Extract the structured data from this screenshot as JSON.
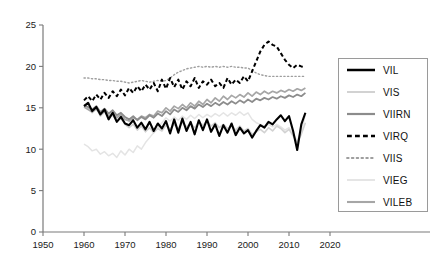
{
  "chart_data": {
    "type": "line",
    "title": "",
    "xlabel": "",
    "ylabel": "",
    "xlim": [
      1950,
      2020
    ],
    "ylim": [
      0,
      25
    ],
    "xticks": [
      1950,
      1960,
      1970,
      1980,
      1990,
      2000,
      2010,
      2020
    ],
    "yticks": [
      0,
      5,
      10,
      15,
      20,
      25
    ],
    "grid": false,
    "legend_position": "right-outside",
    "x": [
      1960,
      1961,
      1962,
      1963,
      1964,
      1965,
      1966,
      1967,
      1968,
      1969,
      1970,
      1971,
      1972,
      1973,
      1974,
      1975,
      1976,
      1977,
      1978,
      1979,
      1980,
      1981,
      1982,
      1983,
      1984,
      1985,
      1986,
      1987,
      1988,
      1989,
      1990,
      1991,
      1992,
      1993,
      1994,
      1995,
      1996,
      1997,
      1998,
      1999,
      2000,
      2001,
      2002,
      2003,
      2004,
      2005,
      2006,
      2007,
      2008,
      2009,
      2010,
      2011,
      2012,
      2013,
      2014
    ],
    "series": [
      {
        "name": "VIL",
        "color": "#000000",
        "width": 2.1,
        "dash": "none",
        "values": [
          15.2,
          15.6,
          14.6,
          15.1,
          14.2,
          14.8,
          13.6,
          14.4,
          13.3,
          13.9,
          13.1,
          12.9,
          13.5,
          12.6,
          13.2,
          12.4,
          13.3,
          12.2,
          13.1,
          12.5,
          13.4,
          11.9,
          13.6,
          12.0,
          13.7,
          12.2,
          13.3,
          11.8,
          13.5,
          12.3,
          13.6,
          12.1,
          13.0,
          11.6,
          12.9,
          12.0,
          13.1,
          11.7,
          12.6,
          11.9,
          12.3,
          11.4,
          12.2,
          12.9,
          12.6,
          13.3,
          13.0,
          13.6,
          14.1,
          13.4,
          14.0,
          12.2,
          9.9,
          13.0,
          14.4
        ]
      },
      {
        "name": "VIS",
        "color": "#d2d2d2",
        "width": 1.6,
        "dash": "none",
        "values": [
          15.4,
          15.0,
          14.4,
          14.9,
          14.0,
          14.5,
          13.8,
          14.1,
          13.4,
          13.7,
          13.0,
          12.6,
          13.0,
          12.3,
          12.8,
          12.1,
          12.6,
          12.0,
          12.5,
          12.2,
          12.9,
          12.4,
          13.0,
          12.5,
          13.2,
          12.7,
          13.1,
          12.6,
          13.3,
          12.9,
          13.4,
          12.8,
          13.2,
          12.6,
          13.0,
          12.5,
          12.9,
          12.3,
          12.8,
          12.2,
          12.5,
          11.8,
          12.1,
          12.4,
          12.0,
          12.6,
          12.2,
          12.8,
          12.5,
          12.0,
          12.4,
          11.6,
          10.8,
          11.8,
          13.2
        ]
      },
      {
        "name": "VIIRN",
        "color": "#8c8c8c",
        "width": 1.8,
        "dash": "none",
        "values": [
          15.3,
          15.1,
          14.8,
          15.2,
          14.5,
          14.9,
          14.3,
          14.7,
          14.1,
          14.4,
          13.9,
          13.6,
          14.0,
          13.5,
          13.9,
          13.6,
          14.1,
          13.8,
          14.3,
          14.0,
          14.6,
          14.2,
          14.8,
          14.5,
          15.0,
          14.7,
          15.2,
          14.9,
          15.4,
          15.1,
          15.5,
          15.2,
          15.6,
          15.3,
          15.7,
          15.4,
          15.8,
          15.5,
          15.9,
          15.6,
          16.0,
          15.7,
          16.1,
          15.9,
          16.2,
          16.0,
          16.3,
          16.1,
          16.4,
          16.2,
          16.5,
          16.3,
          16.6,
          16.4,
          16.8
        ]
      },
      {
        "name": "VIRQ",
        "color": "#000000",
        "width": 2.0,
        "dash": "dashed",
        "values": [
          15.9,
          16.4,
          15.8,
          16.6,
          16.0,
          16.8,
          16.2,
          17.0,
          16.4,
          17.2,
          16.5,
          17.4,
          16.8,
          17.6,
          17.0,
          17.8,
          17.2,
          18.0,
          17.0,
          18.4,
          17.3,
          18.6,
          17.5,
          18.4,
          17.2,
          18.2,
          17.6,
          18.6,
          17.4,
          18.2,
          17.8,
          18.4,
          17.6,
          18.0,
          17.4,
          18.6,
          17.8,
          18.4,
          18.0,
          18.8,
          18.2,
          19.4,
          20.6,
          21.8,
          22.6,
          23.0,
          22.6,
          22.4,
          21.6,
          20.8,
          20.2,
          19.8,
          20.2,
          20.0,
          19.9
        ]
      },
      {
        "name": "VIIS",
        "color": "#9e9e9e",
        "width": 1.4,
        "dash": "dotted",
        "values": [
          18.6,
          18.6,
          18.5,
          18.5,
          18.4,
          18.4,
          18.3,
          18.3,
          18.2,
          18.2,
          18.1,
          18.0,
          18.1,
          18.2,
          18.3,
          18.2,
          18.1,
          18.2,
          18.3,
          18.2,
          18.3,
          18.6,
          19.0,
          19.3,
          19.5,
          19.7,
          19.8,
          19.9,
          20.0,
          19.9,
          20.0,
          19.9,
          20.0,
          19.9,
          20.0,
          19.9,
          20.0,
          19.9,
          19.9,
          19.8,
          19.8,
          19.5,
          19.2,
          19.0,
          18.9,
          18.8,
          18.8,
          18.8,
          18.8,
          18.8,
          18.8,
          18.8,
          18.8,
          18.8,
          18.8
        ]
      },
      {
        "name": "VIEG",
        "color": "#e4e4e4",
        "width": 1.5,
        "dash": "none",
        "values": [
          10.6,
          10.3,
          9.8,
          10.0,
          9.4,
          9.7,
          9.2,
          9.5,
          9.0,
          9.8,
          9.3,
          10.0,
          9.6,
          10.4,
          10.0,
          10.8,
          11.4,
          12.0,
          12.6,
          13.2,
          13.8,
          13.4,
          13.9,
          13.5,
          14.0,
          13.6,
          14.1,
          13.7,
          14.2,
          13.8,
          14.2,
          13.9,
          14.3,
          14.0,
          14.4,
          14.0,
          14.4,
          14.1,
          14.5,
          14.1,
          14.4,
          13.6,
          13.2,
          13.0,
          12.8,
          13.0,
          12.7,
          13.0,
          12.7,
          12.3,
          12.6,
          11.8,
          11.0,
          12.2,
          14.2
        ]
      },
      {
        "name": "VILEB",
        "color": "#a6a6a6",
        "width": 1.7,
        "dash": "none",
        "values": [
          15.1,
          14.8,
          14.5,
          14.9,
          14.2,
          14.6,
          14.0,
          14.4,
          13.8,
          14.2,
          13.6,
          13.4,
          13.8,
          13.6,
          14.0,
          13.8,
          14.2,
          14.0,
          14.6,
          14.4,
          15.0,
          14.6,
          15.2,
          14.9,
          15.4,
          15.0,
          15.6,
          15.2,
          15.8,
          15.4,
          16.0,
          15.6,
          16.2,
          15.8,
          16.4,
          16.0,
          16.5,
          16.2,
          16.6,
          16.3,
          16.8,
          16.4,
          16.9,
          16.6,
          17.0,
          16.7,
          17.0,
          16.8,
          17.1,
          16.9,
          17.2,
          17.0,
          17.3,
          17.1,
          17.4
        ]
      }
    ]
  },
  "axis": {
    "yticks": [
      "0",
      "5",
      "10",
      "15",
      "20",
      "25"
    ],
    "xticks": [
      "1950",
      "1960",
      "1970",
      "1980",
      "1990",
      "2000",
      "2010",
      "2020"
    ]
  },
  "legend": {
    "items": [
      {
        "label": "VIL"
      },
      {
        "label": "VIS"
      },
      {
        "label": "VIIRN"
      },
      {
        "label": "VIRQ"
      },
      {
        "label": "VIIS"
      },
      {
        "label": "VIEG"
      },
      {
        "label": "VILEB"
      }
    ]
  },
  "colors": {
    "axis": "#7a7a7a",
    "text": "#1a1a1a",
    "legend_border": "#9a9a9a",
    "background": "#ffffff"
  }
}
